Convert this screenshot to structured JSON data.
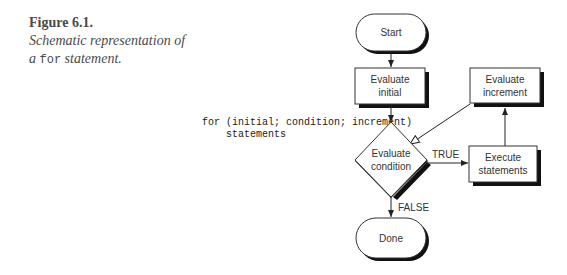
{
  "caption": {
    "title": "Figure 6.1.",
    "line1": "Schematic representation of",
    "line2_prefix": "a ",
    "line2_code": "for",
    "line2_suffix": " statement."
  },
  "code": {
    "line1": "for (initial; condition; increment)",
    "line2": "    statements"
  },
  "nodes": {
    "start": "Start",
    "init_1": "Evaluate",
    "init_2": "initial",
    "incr_1": "Evaluate",
    "incr_2": "increment",
    "cond_1": "Evaluate",
    "cond_2": "condition",
    "exec_1": "Execute",
    "exec_2": "statements",
    "done": "Done"
  },
  "edges": {
    "true_label": "TRUE",
    "false_label": "FALSE"
  }
}
